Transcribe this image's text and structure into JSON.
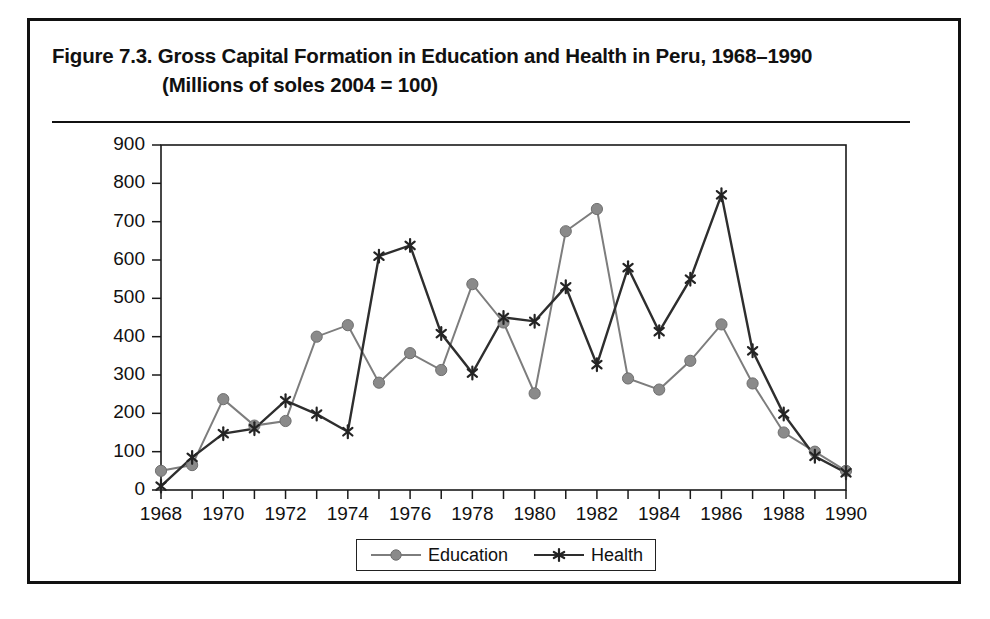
{
  "figure": {
    "title_line1": "Figure 7.3.  Gross Capital Formation in Education and Health in Peru, 1968–1990",
    "title_line2": "(Millions of soles 2004 = 100)"
  },
  "legend": {
    "position": "bottom-center",
    "entries": [
      {
        "label": "Education",
        "marker": "filled-circle",
        "color": "#8a8a8a"
      },
      {
        "label": "Health",
        "marker": "asterisk",
        "color": "#242424"
      }
    ]
  },
  "colors": {
    "education": "#8a8a8a",
    "health": "#242424",
    "frame": "#111111",
    "axis": "#1a1a1a",
    "background": "#ffffff"
  },
  "chart_data": {
    "type": "line",
    "title": "Figure 7.3.  Gross Capital Formation in Education and Health in Peru, 1968–1990 (Millions of soles 2004 = 100)",
    "xlabel": "",
    "ylabel": "",
    "x": [
      1968,
      1969,
      1970,
      1971,
      1972,
      1973,
      1974,
      1975,
      1976,
      1977,
      1978,
      1979,
      1980,
      1981,
      1982,
      1983,
      1984,
      1985,
      1986,
      1987,
      1988,
      1989,
      1990
    ],
    "xlim": [
      1968,
      1990
    ],
    "ylim": [
      0,
      900
    ],
    "xticks": [
      1968,
      1969,
      1970,
      1971,
      1972,
      1973,
      1974,
      1975,
      1976,
      1977,
      1978,
      1979,
      1980,
      1981,
      1982,
      1983,
      1984,
      1985,
      1986,
      1987,
      1988,
      1989,
      1990
    ],
    "xticklabels": [
      "1968",
      "",
      "1970",
      "",
      "1972",
      "",
      "1974",
      "",
      "1976",
      "",
      "1978",
      "",
      "1980",
      "",
      "1982",
      "",
      "1984",
      "",
      "1986",
      "",
      "1988",
      "",
      "1990"
    ],
    "yticks": [
      0,
      100,
      200,
      300,
      400,
      500,
      600,
      700,
      800,
      900
    ],
    "yticklabels": [
      "0",
      "100",
      "200",
      "300",
      "400",
      "500",
      "600",
      "700",
      "800",
      "900"
    ],
    "grid": false,
    "series": [
      {
        "name": "Education",
        "color": "#8a8a8a",
        "marker": "filled-circle",
        "values": [
          50,
          65,
          237,
          168,
          180,
          400,
          430,
          280,
          357,
          313,
          537,
          437,
          252,
          675,
          733,
          291,
          262,
          337,
          432,
          278,
          150,
          100,
          50
        ]
      },
      {
        "name": "Health",
        "color": "#242424",
        "marker": "asterisk",
        "values": [
          10,
          85,
          147,
          160,
          233,
          198,
          152,
          610,
          638,
          408,
          305,
          450,
          440,
          530,
          327,
          580,
          413,
          550,
          770,
          363,
          198,
          88,
          45
        ]
      }
    ]
  }
}
